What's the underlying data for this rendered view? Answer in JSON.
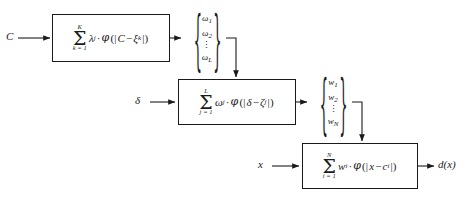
{
  "diagram": {
    "background_color": "#ffffff",
    "line_color": "#1a1a1a"
  },
  "stages": [
    {
      "id": "stage-1",
      "input_label": "C",
      "formula": {
        "sigma_upper": "K",
        "sigma_lower": "k = 1",
        "coefficient": "λ",
        "coefficient_sub": "j",
        "operator": "·",
        "basis": "φ",
        "arg_open": "(|",
        "arg_left": "C",
        "arg_minus": "−",
        "arg_right": "ξ",
        "arg_right_sub": "k",
        "arg_close": "|)"
      },
      "output_vector": {
        "symbol": "ω",
        "items": [
          "ω",
          "ω",
          "ω"
        ],
        "subscripts": [
          "1",
          "2",
          "L"
        ],
        "dots": "⋮"
      }
    },
    {
      "id": "stage-2",
      "input_label": "δ",
      "formula": {
        "sigma_upper": "L",
        "sigma_lower": "j = 1",
        "coefficient": "ω",
        "coefficient_sub": "j",
        "operator": "·",
        "basis": "φ",
        "arg_open": "(|",
        "arg_left": "δ",
        "arg_minus": "−",
        "arg_right": "ζ",
        "arg_right_sub": "j",
        "arg_close": "|)"
      },
      "output_vector": {
        "symbol": "w",
        "items": [
          "w",
          "w",
          "w"
        ],
        "subscripts": [
          "1",
          "2",
          "N"
        ],
        "dots": "⋮"
      }
    },
    {
      "id": "stage-3",
      "input_label": "x",
      "formula": {
        "sigma_upper": "N",
        "sigma_lower": "i = 1",
        "coefficient": "w",
        "coefficient_sub": "i",
        "operator": "·",
        "basis": "φ",
        "arg_open": "(|",
        "arg_left": "x",
        "arg_minus": "−",
        "arg_right": "c",
        "arg_right_sub": "i",
        "arg_close": "|)"
      },
      "output_label": "d(x)"
    }
  ],
  "braces": {
    "left": "{",
    "right": "}"
  }
}
